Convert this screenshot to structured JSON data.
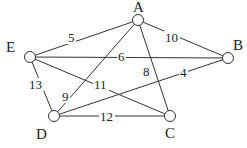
{
  "graph": {
    "nodes": [
      {
        "id": "A",
        "label": "A",
        "x": 138,
        "y": 20,
        "lx": 133,
        "ly": 12
      },
      {
        "id": "B",
        "label": "B",
        "x": 228,
        "y": 58,
        "lx": 233,
        "ly": 50
      },
      {
        "id": "C",
        "label": "C",
        "x": 170,
        "y": 116,
        "lx": 165,
        "ly": 138
      },
      {
        "id": "D",
        "label": "D",
        "x": 54,
        "y": 116,
        "lx": 36,
        "ly": 139
      },
      {
        "id": "E",
        "label": "E",
        "x": 30,
        "y": 57,
        "lx": 6,
        "ly": 52
      }
    ],
    "edges": [
      {
        "from": "E",
        "to": "A",
        "weight": "5",
        "lx": 68,
        "ly": 42
      },
      {
        "from": "A",
        "to": "B",
        "weight": "10",
        "lx": 165,
        "ly": 42
      },
      {
        "from": "E",
        "to": "B",
        "weight": "6",
        "lx": 118,
        "ly": 61
      },
      {
        "from": "A",
        "to": "C",
        "weight": "8",
        "lx": 143,
        "ly": 76
      },
      {
        "from": "B",
        "to": "D",
        "weight": "4",
        "lx": 180,
        "ly": 77
      },
      {
        "from": "E",
        "to": "D",
        "weight": "13",
        "lx": 29,
        "ly": 89
      },
      {
        "from": "A",
        "to": "D",
        "weight": "9",
        "lx": 62,
        "ly": 101
      },
      {
        "from": "E",
        "to": "C",
        "weight": "11",
        "lx": 94,
        "ly": 89
      },
      {
        "from": "D",
        "to": "C",
        "weight": "12",
        "lx": 100,
        "ly": 121
      }
    ]
  }
}
